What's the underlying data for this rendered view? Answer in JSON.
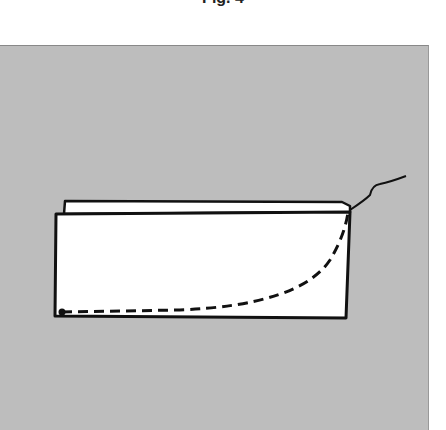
{
  "caption": "Fig. 4",
  "figure": {
    "background_color": "#bdbdbd",
    "fabric_color": "#ffffff",
    "line_color": "#111111"
  }
}
